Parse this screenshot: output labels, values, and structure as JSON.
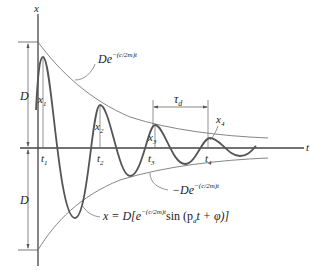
{
  "diagram": {
    "type": "damped-oscillation",
    "axes": {
      "vertical_label": "x",
      "horizontal_label": "t"
    },
    "dimension_labels": {
      "upper_amplitude": "D",
      "lower_amplitude": "D",
      "period": "τ",
      "period_sub": "d"
    },
    "envelopes": {
      "upper": {
        "base": "De",
        "exponent": "−(c/2m)t"
      },
      "lower": {
        "base": "−De",
        "exponent": "−(c/2m)t"
      }
    },
    "peaks": [
      {
        "label": "x",
        "sub": "1",
        "time_label": "t",
        "time_sub": "1"
      },
      {
        "label": "x",
        "sub": "2",
        "time_label": "t",
        "time_sub": "2"
      },
      {
        "label": "x",
        "sub": "3",
        "time_label": "t",
        "time_sub": "3"
      },
      {
        "label": "x",
        "sub": "4",
        "time_label": "t",
        "time_sub": "4"
      }
    ],
    "equation": {
      "lhs": "x = D[e",
      "exponent": "−(c/2m)t",
      "rhs_a": "sin (p",
      "rhs_sub": "d",
      "rhs_b": "t + φ)]"
    },
    "colors": {
      "curve": "#555555",
      "envelope": "#777777",
      "axis": "#444444",
      "text": "#222222"
    }
  }
}
